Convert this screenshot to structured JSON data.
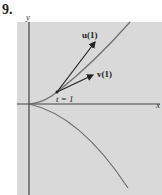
{
  "problem_number": "9.",
  "figure": {
    "axis_x_label": "x",
    "axis_y_label": "y",
    "vector_u_label": "u(1)",
    "vector_v_label": "v(1)",
    "point_label": "t = 1",
    "colors": {
      "background": "#d9d9d9",
      "axes": "#444444",
      "curve": "#6e6e6e",
      "vectors": "#222222"
    }
  }
}
